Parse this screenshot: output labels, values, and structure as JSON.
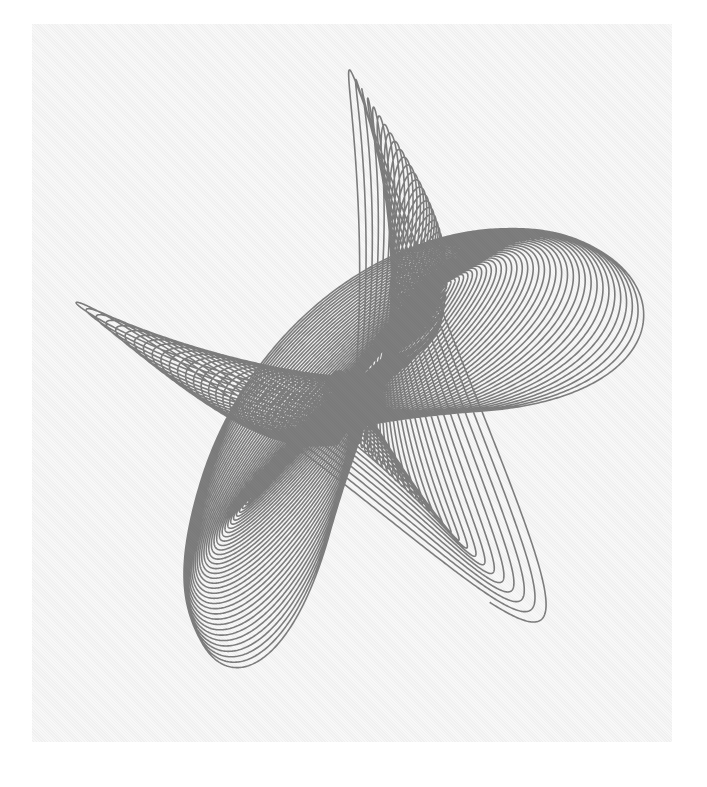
{
  "artwork": {
    "kind": "harmonograph",
    "description": "Black ink harmonograph drawing of decaying looping curves forming two crossing diagonal bands on a light gray paper square",
    "colors": {
      "background": "#ffffff",
      "paper": "#f4f4f4",
      "ink": "#1a1a1a"
    },
    "paper_rect": {
      "x": 32,
      "y": 24,
      "width": 640,
      "height": 718
    },
    "center": {
      "x": 360,
      "y": 385
    },
    "pendulums": {
      "x": [
        {
          "amp": 175,
          "freq": 2.0,
          "phase": 0.0,
          "decay": 0.0045
        },
        {
          "amp": 130,
          "freq": 3.01,
          "phase": 1.5,
          "decay": 0.0045
        }
      ],
      "y": [
        {
          "amp": 170,
          "freq": 3.0,
          "phase": 0.6,
          "decay": 0.0045
        },
        {
          "amp": 150,
          "freq": 2.005,
          "phase": 2.2,
          "decay": 0.0045
        }
      ]
    },
    "t_max": 260,
    "steps": 60000,
    "line_width": 1.6
  }
}
